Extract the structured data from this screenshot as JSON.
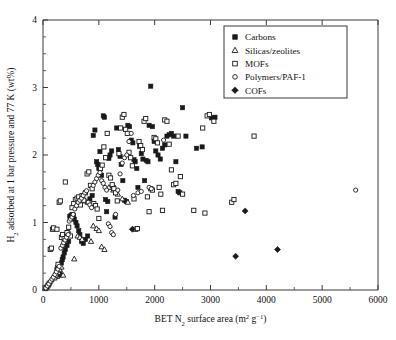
{
  "figure": {
    "background": "#ffffff",
    "foreground": "#111111"
  },
  "chart_data": {
    "type": "scatter",
    "title": "",
    "xlabel": "BET N2 surface area (m2 g-1)",
    "xlabel_parts": {
      "pre": "BET N",
      "sub": "2",
      "mid": " surface area (m",
      "sup1": "2",
      "mid2": " g",
      "sup2": "−1",
      "post": ")"
    },
    "ylabel": "H2 adsorbed at 1 bar pressure and 77 K (wt%)",
    "ylabel_parts": {
      "pre": "H",
      "sub": "2",
      "post": " adsorbed at 1 bar pressure and 77 K (wt%)"
    },
    "xlim": [
      0,
      6000
    ],
    "ylim": [
      0,
      4
    ],
    "xticks": [
      0,
      1000,
      2000,
      3000,
      4000,
      5000,
      6000
    ],
    "yticks": [
      0,
      1,
      2,
      3,
      4
    ],
    "x_minor_step": 500,
    "y_minor_step": 0.25,
    "grid": false,
    "legend_position": "top-right",
    "series": [
      {
        "name": "Carbons",
        "marker": "filled-square",
        "color": "#1a1a1a",
        "points": [
          [
            250,
            0.3
          ],
          [
            265,
            0.33
          ],
          [
            280,
            0.36
          ],
          [
            300,
            0.27
          ],
          [
            315,
            0.22
          ],
          [
            330,
            0.4
          ],
          [
            345,
            0.45
          ],
          [
            360,
            0.49
          ],
          [
            380,
            0.55
          ],
          [
            400,
            0.6
          ],
          [
            430,
            0.66
          ],
          [
            460,
            0.72
          ],
          [
            480,
            1.09
          ],
          [
            500,
            1.1
          ],
          [
            520,
            1.12
          ],
          [
            545,
            1.11
          ],
          [
            560,
            1.05
          ],
          [
            590,
            1.0
          ],
          [
            610,
            0.95
          ],
          [
            640,
            0.88
          ],
          [
            660,
            0.82
          ],
          [
            690,
            0.72
          ],
          [
            720,
            0.69
          ],
          [
            760,
            0.75
          ],
          [
            800,
            0.8
          ],
          [
            840,
            1.35
          ],
          [
            880,
            1.4
          ],
          [
            900,
            2.29
          ],
          [
            930,
            2.37
          ],
          [
            960,
            1.9
          ],
          [
            980,
            1.86
          ],
          [
            1000,
            1.8
          ],
          [
            1020,
            2.05
          ],
          [
            1050,
            1.7
          ],
          [
            1080,
            2.58
          ],
          [
            1100,
            2.56
          ],
          [
            1120,
            1.34
          ],
          [
            1140,
            1.16
          ],
          [
            1160,
            1.31
          ],
          [
            1180,
            1.95
          ],
          [
            1200,
            2.0
          ],
          [
            1230,
            2.06
          ],
          [
            1260,
            1.52
          ],
          [
            1290,
            1.08
          ],
          [
            1320,
            2.4
          ],
          [
            1350,
            2.08
          ],
          [
            1380,
            1.98
          ],
          [
            1400,
            1.86
          ],
          [
            1430,
            1.62
          ],
          [
            1460,
            1.33
          ],
          [
            1490,
            1.31
          ],
          [
            1520,
            2.44
          ],
          [
            1550,
            2.42
          ],
          [
            1580,
            2.22
          ],
          [
            1610,
            2.18
          ],
          [
            1630,
            1.93
          ],
          [
            1650,
            1.9
          ],
          [
            1680,
            1.8
          ],
          [
            1700,
            1.52
          ],
          [
            1730,
            2.13
          ],
          [
            1760,
            2.02
          ],
          [
            1790,
            1.94
          ],
          [
            1820,
            1.62
          ],
          [
            1850,
            1.92
          ],
          [
            1880,
            1.9
          ],
          [
            1900,
            2.44
          ],
          [
            1930,
            3.02
          ],
          [
            1960,
            2.42
          ],
          [
            1990,
            2.2
          ],
          [
            2020,
            2.06
          ],
          [
            2060,
            2.0
          ],
          [
            2100,
            1.94
          ],
          [
            2140,
            2.1
          ],
          [
            2180,
            2.15
          ],
          [
            2220,
            2.28
          ],
          [
            2260,
            2.3
          ],
          [
            2300,
            2.32
          ],
          [
            2340,
            2.28
          ],
          [
            2380,
            1.9
          ],
          [
            2420,
            1.46
          ],
          [
            2450,
            1.44
          ],
          [
            2500,
            2.7
          ],
          [
            2560,
            2.28
          ],
          [
            2750,
            2.1
          ],
          [
            2850,
            2.12
          ],
          [
            3020,
            2.55
          ],
          [
            3080,
            2.56
          ],
          [
            3400,
            2.9
          ]
        ]
      },
      {
        "name": "Silicas/zeolites",
        "marker": "open-triangle",
        "color": "#1a1a1a",
        "points": [
          [
            40,
            0.02
          ],
          [
            70,
            0.05
          ],
          [
            95,
            0.08
          ],
          [
            120,
            0.12
          ],
          [
            150,
            0.15
          ],
          [
            175,
            0.18
          ],
          [
            200,
            0.21
          ],
          [
            225,
            0.24
          ],
          [
            250,
            0.2
          ],
          [
            275,
            0.26
          ],
          [
            300,
            0.3
          ],
          [
            330,
            0.34
          ],
          [
            360,
            0.22
          ],
          [
            420,
            0.85
          ],
          [
            450,
            0.88
          ],
          [
            560,
            0.46
          ],
          [
            620,
            0.8
          ],
          [
            660,
            0.78
          ],
          [
            700,
            0.75
          ],
          [
            760,
            1.32
          ],
          [
            800,
            1.3
          ],
          [
            860,
            0.72
          ],
          [
            900,
            0.95
          ],
          [
            960,
            0.91
          ],
          [
            1000,
            0.88
          ],
          [
            1050,
            0.64
          ],
          [
            1100,
            0.6
          ],
          [
            1180,
            1.52
          ],
          [
            1260,
            1.48
          ],
          [
            1340,
            1.42
          ],
          [
            1420,
            1.35
          ],
          [
            1520,
            1.3
          ]
        ]
      },
      {
        "name": "MOFs",
        "marker": "open-square",
        "color": "#1a1a1a",
        "points": [
          [
            60,
            0.04
          ],
          [
            90,
            0.07
          ],
          [
            110,
            0.1
          ],
          [
            130,
            0.6
          ],
          [
            150,
            0.62
          ],
          [
            170,
            0.9
          ],
          [
            190,
            0.92
          ],
          [
            210,
            0.18
          ],
          [
            230,
            0.22
          ],
          [
            250,
            0.9
          ],
          [
            270,
            0.38
          ],
          [
            290,
            1.3
          ],
          [
            310,
            1.32
          ],
          [
            330,
            0.78
          ],
          [
            350,
            0.82
          ],
          [
            380,
            0.76
          ],
          [
            400,
            1.6
          ],
          [
            430,
            0.85
          ],
          [
            460,
            0.93
          ],
          [
            490,
            0.8
          ],
          [
            520,
            1.22
          ],
          [
            550,
            1.28
          ],
          [
            580,
            1.34
          ],
          [
            610,
            1.36
          ],
          [
            640,
            1.38
          ],
          [
            670,
            1.26
          ],
          [
            700,
            1.4
          ],
          [
            730,
            1.33
          ],
          [
            760,
            1.44
          ],
          [
            790,
            1.72
          ],
          [
            820,
            1.75
          ],
          [
            850,
            1.55
          ],
          [
            880,
            1.5
          ],
          [
            910,
            1.28
          ],
          [
            940,
            1.25
          ],
          [
            970,
            1.2
          ],
          [
            1000,
            1.06
          ],
          [
            1030,
            1.8
          ],
          [
            1060,
            1.85
          ],
          [
            1090,
            2.12
          ],
          [
            1120,
            1.96
          ],
          [
            1150,
            2.32
          ],
          [
            1180,
            1.7
          ],
          [
            1210,
            1.66
          ],
          [
            1240,
            1.56
          ],
          [
            1270,
            1.5
          ],
          [
            1300,
            1.44
          ],
          [
            1330,
            1.32
          ],
          [
            1360,
            2.02
          ],
          [
            1390,
            2.4
          ],
          [
            1420,
            2.56
          ],
          [
            1450,
            2.6
          ],
          [
            1480,
            2.38
          ],
          [
            1510,
            2.32
          ],
          [
            1540,
            2.04
          ],
          [
            1570,
            1.96
          ],
          [
            1600,
            1.84
          ],
          [
            1630,
            1.35
          ],
          [
            1660,
            0.9
          ],
          [
            1690,
            0.91
          ],
          [
            1720,
            2.2
          ],
          [
            1750,
            2.14
          ],
          [
            1780,
            2.08
          ],
          [
            1810,
            2.5
          ],
          [
            1840,
            2.54
          ],
          [
            1870,
            1.38
          ],
          [
            1900,
            1.16
          ],
          [
            1930,
            1.5
          ],
          [
            1960,
            1.48
          ],
          [
            1990,
            2.26
          ],
          [
            2020,
            2.24
          ],
          [
            2050,
            2.18
          ],
          [
            2080,
            1.52
          ],
          [
            2110,
            1.42
          ],
          [
            2140,
            1.18
          ],
          [
            2180,
            2.52
          ],
          [
            2220,
            2.5
          ],
          [
            2260,
            2.16
          ],
          [
            2300,
            1.78
          ],
          [
            2340,
            1.56
          ],
          [
            2380,
            1.58
          ],
          [
            2420,
            2.28
          ],
          [
            2460,
            1.68
          ],
          [
            2500,
            1.42
          ],
          [
            2700,
            1.18
          ],
          [
            2860,
            2.4
          ],
          [
            2900,
            1.14
          ],
          [
            2940,
            2.58
          ],
          [
            2980,
            2.6
          ],
          [
            3060,
            2.5
          ],
          [
            3380,
            1.3
          ],
          [
            3420,
            1.34
          ],
          [
            3780,
            2.28
          ]
        ]
      },
      {
        "name": "Polymers/PAF-1",
        "marker": "open-circle",
        "color": "#1a1a1a",
        "points": [
          [
            50,
            0.03
          ],
          [
            80,
            0.06
          ],
          [
            105,
            0.09
          ],
          [
            135,
            0.13
          ],
          [
            160,
            0.16
          ],
          [
            185,
            0.19
          ],
          [
            215,
            0.23
          ],
          [
            240,
            0.27
          ],
          [
            265,
            0.31
          ],
          [
            290,
            0.35
          ],
          [
            320,
            0.62
          ],
          [
            350,
            0.66
          ],
          [
            370,
            0.7
          ],
          [
            395,
            0.74
          ],
          [
            420,
            0.78
          ],
          [
            450,
            0.82
          ],
          [
            470,
            1.02
          ],
          [
            495,
            1.05
          ],
          [
            520,
            1.08
          ],
          [
            540,
            1.12
          ],
          [
            570,
            1.2
          ],
          [
            600,
            1.25
          ],
          [
            630,
            1.3
          ],
          [
            660,
            1.33
          ],
          [
            690,
            1.36
          ],
          [
            720,
            1.4
          ],
          [
            750,
            1.44
          ],
          [
            780,
            1.47
          ],
          [
            810,
            1.3
          ],
          [
            840,
            1.26
          ],
          [
            870,
            1.22
          ],
          [
            900,
            1.55
          ],
          [
            930,
            1.6
          ],
          [
            960,
            1.65
          ],
          [
            990,
            1.7
          ],
          [
            1020,
            1.74
          ],
          [
            1050,
            1.62
          ],
          [
            1080,
            1.58
          ],
          [
            1110,
            1.52
          ],
          [
            1140,
            1.48
          ],
          [
            1170,
            0.98
          ],
          [
            1200,
            0.94
          ],
          [
            1230,
            0.85
          ],
          [
            1260,
            0.82
          ],
          [
            1300,
            1.12
          ],
          [
            1340,
            1.48
          ],
          [
            1380,
            1.72
          ],
          [
            1420,
            1.88
          ],
          [
            1460,
            1.96
          ],
          [
            1500,
            2.0
          ],
          [
            1540,
            2.2
          ],
          [
            1580,
            2.32
          ],
          [
            1620,
            1.4
          ],
          [
            1700,
            1.44
          ],
          [
            1760,
            1.46
          ],
          [
            1900,
            1.52
          ],
          [
            1940,
            1.5
          ],
          [
            2160,
            2.22
          ],
          [
            5600,
            1.48
          ]
        ]
      },
      {
        "name": "COFs",
        "marker": "filled-diamond",
        "color": "#1a1a1a",
        "points": [
          [
            1600,
            0.9
          ],
          [
            3450,
            0.5
          ],
          [
            3620,
            1.17
          ],
          [
            4200,
            0.6
          ]
        ]
      }
    ]
  },
  "legend": {
    "items": [
      {
        "label": "Carbons",
        "marker": "filled-square"
      },
      {
        "label": "Silicas/zeolites",
        "marker": "open-triangle"
      },
      {
        "label": "MOFs",
        "marker": "open-square"
      },
      {
        "label": "Polymers/PAF-1",
        "marker": "open-circle"
      },
      {
        "label": "COFs",
        "marker": "filled-diamond"
      }
    ]
  },
  "axes": {
    "x_tick_labels": [
      "0",
      "1000",
      "2000",
      "3000",
      "4000",
      "5000",
      "6000"
    ],
    "y_tick_labels": [
      "0",
      "1",
      "2",
      "3",
      "4"
    ]
  }
}
